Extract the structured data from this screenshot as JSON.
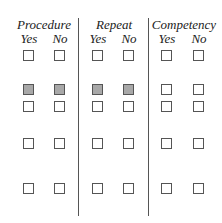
{
  "groups": [
    {
      "label": "Procedure",
      "yes": "Yes",
      "no": "No"
    },
    {
      "label": "Repeat",
      "yes": "Yes",
      "no": "No"
    },
    {
      "label": "Competency",
      "yes": "Yes",
      "no": "No"
    }
  ],
  "rows": [
    {
      "filled": [
        false,
        false,
        false,
        false,
        false,
        false
      ]
    },
    {
      "filled": [
        true,
        true,
        true,
        true,
        false,
        false
      ]
    },
    {
      "filled": [
        false,
        false,
        false,
        false,
        false,
        false
      ]
    },
    {
      "filled": [
        false,
        false,
        false,
        false,
        false,
        false
      ]
    },
    {
      "filled": [
        false,
        false,
        false,
        false,
        false,
        false
      ]
    }
  ],
  "colors": {
    "filled": "#a8a8a8",
    "border": "#555555"
  }
}
